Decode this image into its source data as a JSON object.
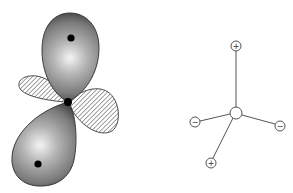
{
  "figure": {
    "left_panel": {
      "name": "orbital-lobe-diagram",
      "nucleus": {
        "x": 68,
        "y": 102,
        "r": 4
      },
      "positive_lobes": [
        {
          "id": "upper",
          "dot": {
            "x": 71,
            "y": 38
          },
          "highlight": {
            "x": 70,
            "y": 58
          }
        },
        {
          "id": "lower",
          "dot": {
            "x": 38,
            "y": 164
          },
          "highlight": {
            "x": 40,
            "y": 145
          }
        }
      ],
      "negative_lobes": [
        {
          "id": "left",
          "fill": "hatched"
        },
        {
          "id": "right",
          "fill": "hatched"
        }
      ],
      "colors": {
        "lobe_dark": "#3a3a3a",
        "lobe_mid": "#8c8c8c",
        "lobe_light": "#f2f2f2",
        "hatch": "#777777",
        "outline": "#333333",
        "dot": "#000000"
      }
    },
    "right_panel": {
      "name": "tetrahedral-charge-diagram",
      "center": {
        "x": 236,
        "y": 113,
        "r": 6,
        "label": ""
      },
      "charges": [
        {
          "id": "top",
          "x": 236,
          "y": 46,
          "label": "+",
          "sign": "positive"
        },
        {
          "id": "left",
          "x": 195,
          "y": 122,
          "label": "−",
          "sign": "negative"
        },
        {
          "id": "right",
          "x": 280,
          "y": 126,
          "label": "−",
          "sign": "negative"
        },
        {
          "id": "bottom",
          "x": 211,
          "y": 163,
          "label": "+",
          "sign": "positive"
        }
      ],
      "charge_radius": 5,
      "colors": {
        "line": "#555555",
        "circle": "#555555"
      }
    }
  }
}
